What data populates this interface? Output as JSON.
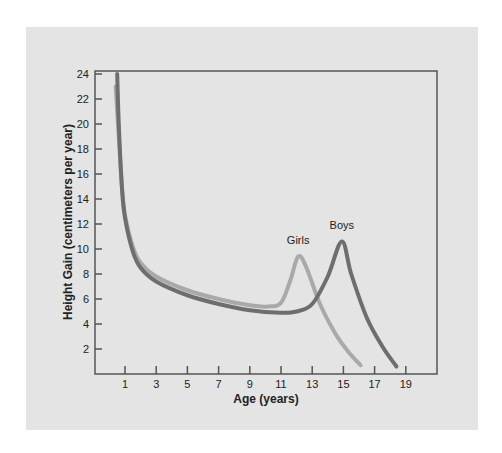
{
  "chart_data": {
    "type": "line",
    "title": "",
    "xlabel": "Age (years)",
    "ylabel": "Height Gain (centimeters per year)",
    "xlim": [
      -0.9,
      21
    ],
    "ylim": [
      0,
      24
    ],
    "x_ticks": [
      1,
      3,
      5,
      7,
      9,
      11,
      13,
      15,
      17,
      19
    ],
    "y_ticks": [
      2,
      4,
      6,
      8,
      10,
      12,
      14,
      16,
      18,
      20,
      22,
      24
    ],
    "grid": false,
    "legend": "none (inline labels at peaks)",
    "series": [
      {
        "name": "Boys",
        "color": "#6e6e6e",
        "label_at": [
          14.9,
          11.6
        ],
        "points": [
          [
            0.5,
            24
          ],
          [
            0.6,
            20
          ],
          [
            0.8,
            15
          ],
          [
            1,
            12.5
          ],
          [
            1.5,
            9.8
          ],
          [
            2,
            8.5
          ],
          [
            3,
            7.4
          ],
          [
            5,
            6.3
          ],
          [
            7,
            5.6
          ],
          [
            9,
            5.1
          ],
          [
            11,
            4.9
          ],
          [
            12,
            5.0
          ],
          [
            13,
            5.6
          ],
          [
            14,
            7.8
          ],
          [
            14.9,
            10.6
          ],
          [
            15.5,
            8.0
          ],
          [
            16.5,
            4.5
          ],
          [
            17.5,
            2.2
          ],
          [
            18.4,
            0.6
          ]
        ]
      },
      {
        "name": "Girls",
        "color": "#a9a9a9",
        "label_at": [
          12.1,
          10.4
        ],
        "points": [
          [
            0.4,
            23
          ],
          [
            0.6,
            19
          ],
          [
            0.8,
            15
          ],
          [
            1,
            12.7
          ],
          [
            1.5,
            10.2
          ],
          [
            2,
            8.9
          ],
          [
            3,
            7.8
          ],
          [
            5,
            6.7
          ],
          [
            7,
            6.0
          ],
          [
            9,
            5.5
          ],
          [
            10.2,
            5.4
          ],
          [
            11,
            5.7
          ],
          [
            11.6,
            7.5
          ],
          [
            12.1,
            9.4
          ],
          [
            12.6,
            8.6
          ],
          [
            13.5,
            5.6
          ],
          [
            14.5,
            3.2
          ],
          [
            15.3,
            1.8
          ],
          [
            16.1,
            0.7
          ]
        ]
      }
    ]
  },
  "colors": {
    "panel_background": "#e4e4e4",
    "frame": "#555555",
    "text": "#222222"
  }
}
